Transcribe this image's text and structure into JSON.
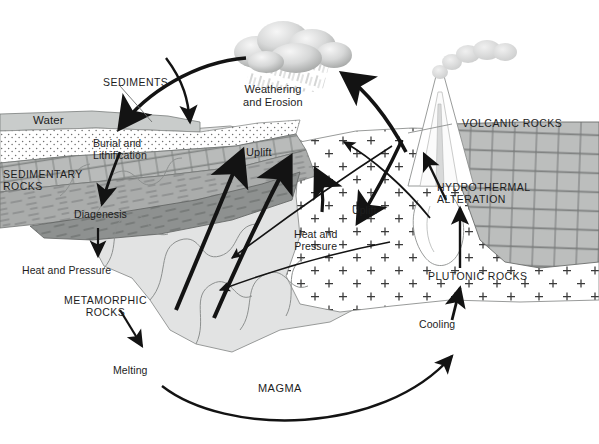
{
  "diagram": {
    "type": "geologic-cross-section",
    "background": "#ffffff",
    "ink": "#1a1a1a"
  },
  "palette": {
    "water": "#c9cccb",
    "sediment_stipple_fill": "#ffffff",
    "sediment_stipple_dot": "#6e6e6e",
    "sedimentary_brick": "#b9bbba",
    "sedimentary_shale": "#a9abaa",
    "sedimentary_dark": "#8e9190",
    "metamorphic": "#e2e3e3",
    "metamorphic_line": "#8d908f",
    "plutonic_fill": "#ffffff",
    "plutonic_cross": "#3a3a3a",
    "volcanic_brick": "#bcbebd",
    "volcanic_brick_line": "#6b6d6c",
    "cloud_light": "#ededed",
    "cloud_mid": "#cfd0d0",
    "cloud_dark": "#a8aaa9",
    "plume": "#d8d9d9",
    "arrow": "#131313"
  },
  "labels": {
    "sediments": "SEDIMENTS",
    "water": "Water",
    "burial_and_lithification": "Burial and\nLithification",
    "sedimentary_rocks": "SEDIMENTARY\nROCKS",
    "diagenesis": "Diagenesis",
    "heat_and_pressure_left": "Heat and Pressure",
    "metamorphic_rocks": "METAMORPHIC\nROCKS",
    "melting": "Melting",
    "weathering_and_erosion": "Weathering\nand Erosion",
    "uplift_left": "Uplift",
    "uplift_right": "Uplift",
    "heat_and_pressure_center": "Heat and\nPressure",
    "magma": "MAGMA",
    "cooling": "Cooling",
    "volcanic_rocks": "VOLCANIC ROCKS",
    "hydrothermal_alteration": "HYDROTHERMAL\nALTERATION",
    "plutonic_rocks": "PLUTONIC ROCKS"
  },
  "processes": [
    {
      "name": "weathering-and-erosion",
      "from": "rocks-at-surface",
      "to": "sediments"
    },
    {
      "name": "burial-and-lithification",
      "from": "sediments",
      "to": "sedimentary-rocks"
    },
    {
      "name": "diagenesis",
      "from": "sedimentary-rocks",
      "to": "deeper-burial"
    },
    {
      "name": "heat-and-pressure",
      "from": "sedimentary-rocks",
      "to": "metamorphic-rocks"
    },
    {
      "name": "melting",
      "from": "metamorphic-rocks",
      "to": "magma"
    },
    {
      "name": "cooling",
      "from": "magma",
      "to": "plutonic-rocks"
    },
    {
      "name": "hydrothermal-alteration",
      "from": "plutonic-rocks",
      "to": "volcanic-rocks"
    },
    {
      "name": "uplift",
      "from": "deep-rocks",
      "to": "surface"
    }
  ],
  "zones": [
    {
      "name": "water-body",
      "label": "Water"
    },
    {
      "name": "sediment-layer",
      "label": "SEDIMENTS"
    },
    {
      "name": "sedimentary-rock-body",
      "label": "SEDIMENTARY ROCKS"
    },
    {
      "name": "metamorphic-rock-body",
      "label": "METAMORPHIC ROCKS"
    },
    {
      "name": "plutonic-rock-body",
      "label": "PLUTONIC ROCKS"
    },
    {
      "name": "volcanic-rock-body",
      "label": "VOLCANIC ROCKS"
    }
  ],
  "fonts": {
    "caps_size": "10.5px",
    "mixed_size": "11px",
    "magma_size": "11px"
  }
}
